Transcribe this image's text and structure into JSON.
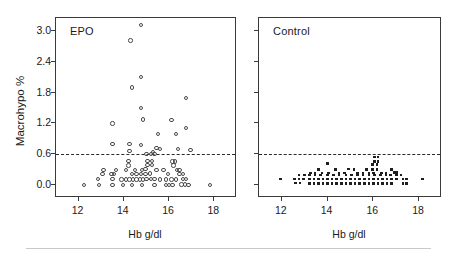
{
  "figure": {
    "width": 457,
    "height": 255,
    "background": "#ffffff",
    "bottom_rule_color": "#c9c9c9"
  },
  "axes": {
    "ylabel": "Macrohypo %",
    "xlabel": "Hb g/dl",
    "ytick_labels": [
      "0.0",
      "0.6",
      "1.2",
      "1.8",
      "2.4",
      "3.0"
    ],
    "xtick_labels": [
      "12",
      "14",
      "16",
      "18"
    ]
  },
  "panels": {
    "left_title": "EPO",
    "right_title": "Control"
  },
  "chart_data": {
    "type": "scatter",
    "title": "",
    "xlabel": "Hb g/dl",
    "ylabel": "Macrohypo %",
    "xlim": [
      11.0,
      19.0
    ],
    "ylim": [
      -0.25,
      3.25
    ],
    "xticks": [
      12,
      14,
      16,
      18
    ],
    "yticks": [
      0.0,
      0.6,
      1.2,
      1.8,
      2.4,
      3.0
    ],
    "grid": false,
    "legend": null,
    "annotations": [
      {
        "text": "EPO",
        "panel": "left",
        "position": "top-left"
      },
      {
        "text": "Control",
        "panel": "right",
        "position": "top-left"
      }
    ],
    "reference_lines": [
      {
        "orientation": "horizontal",
        "y": 0.6,
        "style": "dashed",
        "color": "#2a2a2a",
        "panels": [
          "left",
          "right"
        ]
      }
    ],
    "series": [
      {
        "name": "EPO",
        "panel": "left",
        "marker": "open-circle",
        "color": "#4a4a4a",
        "points": [
          [
            14.75,
            3.11
          ],
          [
            14.3,
            2.81
          ],
          [
            14.75,
            2.1
          ],
          [
            14.35,
            1.9
          ],
          [
            14.75,
            1.5
          ],
          [
            16.75,
            1.7
          ],
          [
            14.85,
            1.28
          ],
          [
            16.1,
            1.27
          ],
          [
            13.5,
            1.2
          ],
          [
            16.75,
            1.11
          ],
          [
            15.5,
            1.0
          ],
          [
            16.3,
            1.0
          ],
          [
            13.5,
            0.8
          ],
          [
            14.25,
            0.8
          ],
          [
            14.75,
            0.78
          ],
          [
            15.45,
            0.72
          ],
          [
            16.4,
            0.7
          ],
          [
            16.95,
            0.68
          ],
          [
            14.25,
            0.66
          ],
          [
            15.3,
            0.65
          ],
          [
            15.6,
            0.7
          ],
          [
            15.0,
            0.6
          ],
          [
            15.2,
            0.6
          ],
          [
            15.35,
            0.6
          ],
          [
            14.2,
            0.47
          ],
          [
            15.05,
            0.47
          ],
          [
            15.25,
            0.47
          ],
          [
            16.15,
            0.46
          ],
          [
            16.25,
            0.46
          ],
          [
            14.2,
            0.38
          ],
          [
            15.05,
            0.39
          ],
          [
            15.25,
            0.39
          ],
          [
            16.2,
            0.38
          ],
          [
            13.1,
            0.3
          ],
          [
            13.65,
            0.3
          ],
          [
            14.1,
            0.3
          ],
          [
            14.5,
            0.3
          ],
          [
            14.8,
            0.3
          ],
          [
            14.95,
            0.31
          ],
          [
            15.45,
            0.3
          ],
          [
            15.75,
            0.3
          ],
          [
            16.35,
            0.3
          ],
          [
            16.45,
            0.3
          ],
          [
            13.05,
            0.22
          ],
          [
            13.45,
            0.22
          ],
          [
            13.55,
            0.22
          ],
          [
            14.35,
            0.22
          ],
          [
            14.55,
            0.22
          ],
          [
            14.75,
            0.22
          ],
          [
            14.95,
            0.22
          ],
          [
            15.15,
            0.23
          ],
          [
            15.95,
            0.22
          ],
          [
            16.45,
            0.22
          ],
          [
            16.6,
            0.22
          ],
          [
            12.85,
            0.12
          ],
          [
            13.5,
            0.12
          ],
          [
            13.9,
            0.11
          ],
          [
            14.1,
            0.11
          ],
          [
            14.25,
            0.11
          ],
          [
            14.4,
            0.11
          ],
          [
            14.55,
            0.11
          ],
          [
            14.7,
            0.11
          ],
          [
            14.85,
            0.11
          ],
          [
            15.0,
            0.12
          ],
          [
            15.2,
            0.12
          ],
          [
            15.35,
            0.12
          ],
          [
            15.6,
            0.11
          ],
          [
            15.85,
            0.11
          ],
          [
            16.1,
            0.11
          ],
          [
            16.3,
            0.11
          ],
          [
            16.6,
            0.12
          ],
          [
            16.75,
            0.12
          ],
          [
            12.25,
            0.0
          ],
          [
            12.9,
            0.0
          ],
          [
            13.5,
            0.0
          ],
          [
            13.95,
            0.0
          ],
          [
            14.35,
            0.0
          ],
          [
            14.8,
            0.0
          ],
          [
            15.35,
            0.0
          ],
          [
            15.85,
            0.0
          ],
          [
            16.0,
            0.0
          ],
          [
            16.15,
            0.0
          ],
          [
            16.55,
            0.01
          ],
          [
            16.7,
            0.01
          ],
          [
            16.85,
            0.0
          ],
          [
            17.8,
            0.0
          ]
        ]
      },
      {
        "name": "Control",
        "panel": "right",
        "marker": "filled-dot",
        "color": "#1f1f1f",
        "points": [
          [
            16.05,
            0.55
          ],
          [
            16.2,
            0.55
          ],
          [
            16.05,
            0.46
          ],
          [
            16.2,
            0.46
          ],
          [
            14.0,
            0.42
          ],
          [
            15.95,
            0.4
          ],
          [
            16.15,
            0.4
          ],
          [
            13.6,
            0.3
          ],
          [
            14.35,
            0.3
          ],
          [
            14.9,
            0.31
          ],
          [
            15.15,
            0.3
          ],
          [
            15.7,
            0.3
          ],
          [
            15.95,
            0.3
          ],
          [
            16.15,
            0.3
          ],
          [
            16.8,
            0.3
          ],
          [
            13.25,
            0.24
          ],
          [
            13.45,
            0.24
          ],
          [
            13.75,
            0.24
          ],
          [
            14.05,
            0.24
          ],
          [
            14.5,
            0.24
          ],
          [
            14.75,
            0.24
          ],
          [
            15.3,
            0.24
          ],
          [
            15.55,
            0.24
          ],
          [
            15.8,
            0.24
          ],
          [
            16.0,
            0.24
          ],
          [
            16.35,
            0.24
          ],
          [
            16.55,
            0.24
          ],
          [
            16.9,
            0.25
          ],
          [
            17.0,
            0.25
          ],
          [
            12.75,
            0.2
          ],
          [
            13.0,
            0.2
          ],
          [
            13.2,
            0.2
          ],
          [
            13.45,
            0.2
          ],
          [
            13.7,
            0.2
          ],
          [
            14.0,
            0.2
          ],
          [
            14.25,
            0.2
          ],
          [
            14.5,
            0.2
          ],
          [
            14.8,
            0.2
          ],
          [
            15.05,
            0.2
          ],
          [
            15.3,
            0.2
          ],
          [
            15.55,
            0.2
          ],
          [
            15.8,
            0.2
          ],
          [
            16.05,
            0.2
          ],
          [
            16.3,
            0.2
          ],
          [
            16.55,
            0.2
          ],
          [
            16.75,
            0.2
          ],
          [
            17.0,
            0.2
          ],
          [
            17.2,
            0.2
          ],
          [
            11.95,
            0.12
          ],
          [
            12.55,
            0.12
          ],
          [
            12.75,
            0.12
          ],
          [
            12.95,
            0.12
          ],
          [
            13.2,
            0.12
          ],
          [
            13.4,
            0.12
          ],
          [
            13.6,
            0.12
          ],
          [
            13.8,
            0.12
          ],
          [
            14.0,
            0.12
          ],
          [
            14.2,
            0.12
          ],
          [
            14.4,
            0.12
          ],
          [
            14.6,
            0.12
          ],
          [
            14.8,
            0.12
          ],
          [
            15.0,
            0.12
          ],
          [
            15.2,
            0.12
          ],
          [
            15.4,
            0.12
          ],
          [
            15.6,
            0.12
          ],
          [
            15.8,
            0.12
          ],
          [
            16.0,
            0.12
          ],
          [
            16.2,
            0.12
          ],
          [
            16.4,
            0.12
          ],
          [
            16.6,
            0.12
          ],
          [
            16.8,
            0.12
          ],
          [
            17.0,
            0.12
          ],
          [
            17.3,
            0.12
          ],
          [
            17.45,
            0.12
          ],
          [
            18.15,
            0.12
          ],
          [
            12.6,
            0.04
          ],
          [
            12.8,
            0.04
          ],
          [
            13.2,
            0.03
          ],
          [
            13.4,
            0.03
          ],
          [
            13.6,
            0.03
          ],
          [
            13.8,
            0.03
          ],
          [
            14.0,
            0.03
          ],
          [
            14.2,
            0.03
          ],
          [
            14.4,
            0.03
          ],
          [
            14.6,
            0.03
          ],
          [
            14.8,
            0.03
          ],
          [
            15.0,
            0.03
          ],
          [
            15.2,
            0.03
          ],
          [
            15.4,
            0.03
          ],
          [
            15.6,
            0.03
          ],
          [
            15.8,
            0.03
          ],
          [
            16.0,
            0.03
          ],
          [
            16.2,
            0.03
          ],
          [
            16.4,
            0.03
          ],
          [
            16.6,
            0.03
          ],
          [
            16.8,
            0.03
          ],
          [
            17.3,
            0.03
          ],
          [
            17.45,
            0.03
          ]
        ]
      }
    ]
  }
}
